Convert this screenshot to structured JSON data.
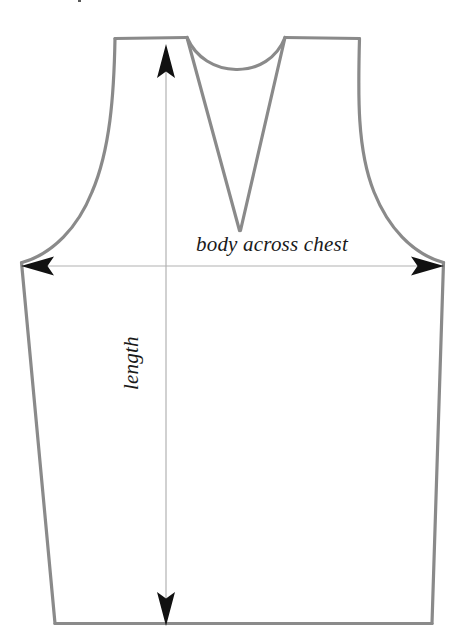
{
  "figure": {
    "kind": "garment-measurement-diagram",
    "background_color": "#ffffff",
    "outline_color": "#8a8a8a",
    "outline_width": 3.2,
    "dimension_line_color": "#b0b0b0",
    "arrowhead_color": "#111111",
    "text_color": "#1a1a1a"
  },
  "labels": {
    "chest": "body across chest",
    "length": "length"
  },
  "dimensions": [
    {
      "name": "body across chest",
      "orientation": "horizontal",
      "from_x": 22,
      "to_x": 443,
      "y": 266,
      "arrowheads": "both"
    },
    {
      "name": "length",
      "orientation": "vertical",
      "x": 166,
      "from_y": 45,
      "to_y": 624,
      "arrowheads": "both"
    }
  ],
  "outline_points": {
    "left_shoulder_outer": [
      115,
      38
    ],
    "left_shoulder_inner": [
      187,
      38
    ],
    "neck_bottom": [
      240,
      230
    ],
    "right_shoulder_inner": [
      285,
      38
    ],
    "right_shoulder_outer": [
      360,
      38
    ],
    "left_underarm": [
      22,
      263
    ],
    "right_underarm": [
      443,
      263
    ],
    "left_hem": [
      55,
      624
    ],
    "right_hem": [
      432,
      624
    ]
  }
}
